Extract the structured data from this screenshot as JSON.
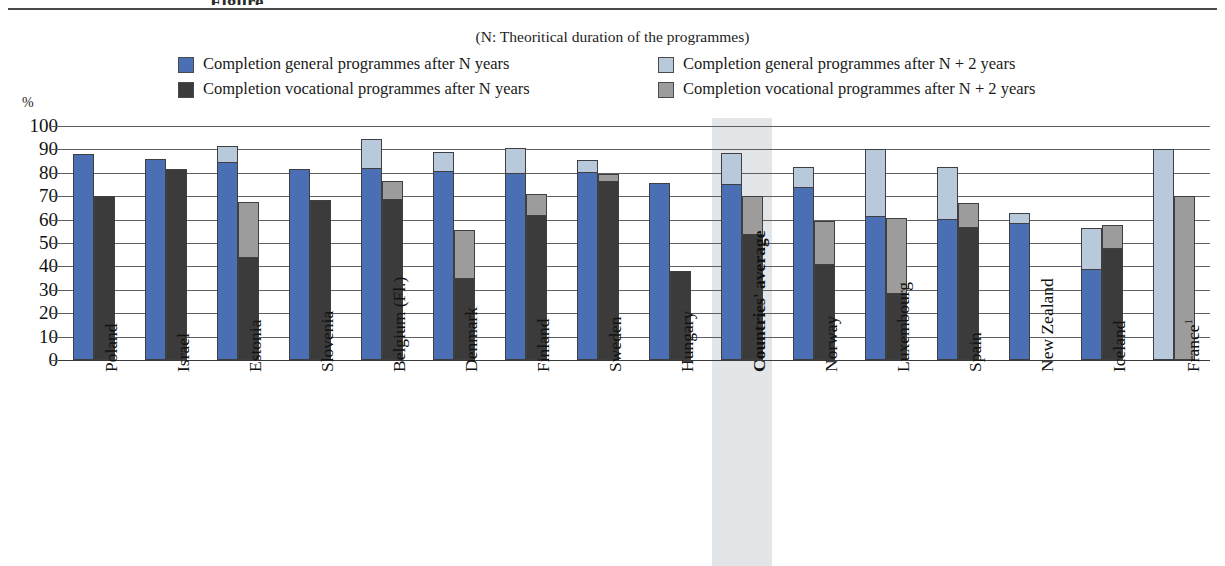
{
  "title_partial": "Figure",
  "subnote": "(N: Theoritical duration of  the programmes)",
  "axis": {
    "unit": "%",
    "ticks": [
      "100",
      "90",
      "80",
      "70",
      "60",
      "50",
      "40",
      "30",
      "20",
      "10",
      "0"
    ]
  },
  "legend": [
    {
      "key": "gen_n",
      "label": "Completion general programmes after N years",
      "color": "#4a6fb5"
    },
    {
      "key": "gen_n2",
      "label": "Completion general programmes after N + 2 years",
      "color": "#b9c9dc"
    },
    {
      "key": "voc_n",
      "label": "Completion vocational programmes after N years",
      "color": "#3b3b3b"
    },
    {
      "key": "voc_n2",
      "label": "Completion vocational programmes after N + 2 years",
      "color": "#9c9c9c"
    }
  ],
  "colors": {
    "general_n": "#4a6fb5",
    "general_n_plus_2": "#b9c9dc",
    "vocational_n": "#3b3b3b",
    "vocational_n_plus_2": "#9c9c9c",
    "highlight_band": "#d9dde1",
    "gridline": "#5f5f5f",
    "text": "#121212"
  },
  "highlight_category": "Countries' average",
  "chart_data": {
    "type": "bar",
    "title": "",
    "subtitle": "(N: Theoritical duration of  the programmes)",
    "xlabel": "",
    "ylabel": "%",
    "ylim": [
      0,
      100
    ],
    "yticks": [
      0,
      10,
      20,
      30,
      40,
      50,
      60,
      70,
      80,
      90,
      100
    ],
    "grid": true,
    "legend_position": "top",
    "stacked": true,
    "note": "Each category has two stacked bars: general (blue base = after N years, light-blue top extends to after N+2 years) and vocational (dark base = after N years, grey top extends to after N+2 years).",
    "categories": [
      "Poland",
      "Israel",
      "Estonia",
      "Slovenia",
      "Belgium (Fl.)",
      "Denmark",
      "Finland",
      "Sweden",
      "Hungary",
      "Countries' average",
      "Norway",
      "Luxembourg",
      "Spain",
      "New Zealand",
      "Iceland",
      "France"
    ],
    "category_labels": [
      "Poland",
      "Israel",
      "Estonia",
      "Slovenia",
      "Belgium (Fl.)",
      "Denmark",
      "Finland",
      "Sweden",
      "Hungary",
      "Countries' average",
      "Norway",
      "Luxembourg",
      "Spain",
      "New Zealand",
      "Iceland",
      "France¹"
    ],
    "series": [
      {
        "name": "Completion general programmes after N years",
        "values": [
          88,
          86,
          84,
          81.5,
          81.5,
          80.5,
          79.5,
          80,
          75.5,
          75,
          73.5,
          61,
          60,
          58,
          38.5,
          null
        ]
      },
      {
        "name": "Completion general programmes after N + 2 years",
        "values": [
          88,
          86,
          91.5,
          81.5,
          94.5,
          89,
          90.5,
          85.5,
          75.5,
          88.5,
          82.5,
          90,
          82.5,
          63,
          56.5,
          90
        ]
      },
      {
        "name": "Completion vocational programmes after N years",
        "values": [
          70,
          81.5,
          43.5,
          68.5,
          68.5,
          34.5,
          61.5,
          76,
          38,
          53.5,
          40.5,
          28,
          56.5,
          null,
          47.5,
          null
        ]
      },
      {
        "name": "Completion vocational programmes after N + 2 years",
        "values": [
          70,
          81.5,
          67.5,
          68.5,
          76.5,
          55.5,
          71,
          79.5,
          38,
          70,
          59.5,
          60.5,
          67,
          null,
          57.5,
          70
        ]
      }
    ]
  }
}
